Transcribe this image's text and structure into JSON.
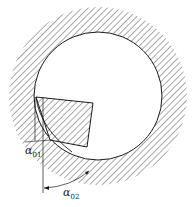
{
  "diagram": {
    "title": "",
    "colors": {
      "line": "#1a1a1a",
      "hatch": "#555555",
      "background": "#ffffff"
    },
    "workpiece": {
      "shape": "hatched-ring",
      "center": [
        98,
        96
      ],
      "inner_radius": 64,
      "outer_radius": 89
    },
    "tool": {
      "shape": "hatched-quadrilateral",
      "points": [
        [
          36,
          97
        ],
        [
          93,
          103
        ],
        [
          87,
          147
        ],
        [
          50,
          140
        ]
      ]
    },
    "labels": {
      "alpha01": {
        "symbol": "α",
        "subscript": "01"
      },
      "alpha02": {
        "symbol": "α",
        "subscript": "02"
      }
    }
  }
}
